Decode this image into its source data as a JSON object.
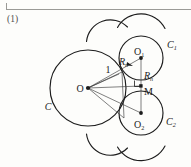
{
  "page": {
    "figure_number": "(1)",
    "background_color": "#fdfdfb",
    "rule_color": "#9a9a96",
    "stroke_color": "#1c1c1c"
  },
  "figure": {
    "name": "tangent-circles-geometry-diagram",
    "labels": {
      "big_circle": "C",
      "center": "O",
      "radius_value": "1",
      "circle_one": "C",
      "circle_one_sub": "1",
      "circle_two": "C",
      "circle_two_sub": "2",
      "center_one": "O",
      "center_one_sub": "1",
      "center_two": "O",
      "center_two_sub": "2",
      "midpoint": "M",
      "radius_upper": "R",
      "radius_upper_sub": "n",
      "radius_lower": "R",
      "radius_lower_sub": "n"
    },
    "geometry": {
      "big_circle": {
        "cx": 88,
        "cy": 88,
        "r": 38
      },
      "circle_one": {
        "cx": 141,
        "cy": 58,
        "r": 22
      },
      "circle_two": {
        "cx": 141,
        "cy": 113,
        "r": 22
      },
      "arc_top_left": {
        "cx": 104,
        "cy": 30,
        "r": 24
      },
      "arc_top_right": {
        "cx": 141,
        "cy": 14,
        "r": 27
      },
      "arc_bottom_left": {
        "cx": 104,
        "cy": 146,
        "r": 24
      },
      "arc_bottom_right": {
        "cx": 141,
        "cy": 160,
        "r": 27
      },
      "tangent_point": {
        "x": 141,
        "y": 86
      },
      "dots": [
        {
          "x": 88,
          "y": 88
        },
        {
          "x": 141,
          "y": 58
        },
        {
          "x": 141,
          "y": 113
        },
        {
          "x": 141,
          "y": 86
        }
      ]
    }
  }
}
